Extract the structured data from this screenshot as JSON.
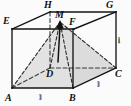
{
  "figure": {
    "name": "cube-with-inscribed-pyramid",
    "background_color": "#fbfbfb",
    "stroke_color": "#1a1a1a",
    "shade_color": "#d8d8d8",
    "dash_color": "#3a3a3a"
  },
  "vertices": [
    {
      "id": "A",
      "label": "A",
      "x": 12,
      "y": 88,
      "label_x": 6,
      "label_y": 93
    },
    {
      "id": "B",
      "label": "B",
      "x": 73,
      "y": 88,
      "label_x": 70,
      "label_y": 93
    },
    {
      "id": "C",
      "label": "C",
      "x": 116,
      "y": 68,
      "label_x": 115,
      "label_y": 70
    },
    {
      "id": "D",
      "label": "D",
      "x": 50,
      "y": 68,
      "label_x": 47,
      "label_y": 70
    },
    {
      "id": "E",
      "label": "E",
      "x": 12,
      "y": 29,
      "label_x": 3,
      "label_y": 17
    },
    {
      "id": "F",
      "label": "F",
      "x": 74,
      "y": 29,
      "label_x": 70,
      "label_y": 18
    },
    {
      "id": "G",
      "label": "G",
      "x": 116,
      "y": 12,
      "label_x": 108,
      "label_y": 1
    },
    {
      "id": "H",
      "label": "H",
      "x": 50,
      "y": 12,
      "label_x": 45,
      "label_y": 1
    },
    {
      "id": "M",
      "label": "M",
      "x": 60,
      "y": 22,
      "label_x": 56,
      "label_y": 12
    }
  ],
  "edge_labels": [
    {
      "id": "AB",
      "text": "1",
      "x": 41,
      "y": 92
    },
    {
      "id": "BC",
      "text": "1",
      "x": 98,
      "y": 79
    },
    {
      "id": "CG",
      "text": "1",
      "x": 118,
      "y": 36
    }
  ],
  "solid_edges": [
    {
      "from": "A",
      "to": "B"
    },
    {
      "from": "B",
      "to": "C"
    },
    {
      "from": "A",
      "to": "E"
    },
    {
      "from": "B",
      "to": "F"
    },
    {
      "from": "C",
      "to": "G"
    },
    {
      "from": "E",
      "to": "F"
    },
    {
      "from": "F",
      "to": "G"
    },
    {
      "from": "E",
      "to": "H"
    },
    {
      "from": "H",
      "to": "G"
    }
  ],
  "hidden_edges": [
    {
      "from": "A",
      "to": "D"
    },
    {
      "from": "D",
      "to": "C"
    },
    {
      "from": "D",
      "to": "H"
    }
  ],
  "pyramid_edges": [
    {
      "from": "A",
      "to": "M"
    },
    {
      "from": "B",
      "to": "M"
    },
    {
      "from": "C",
      "to": "M"
    },
    {
      "from": "D",
      "to": "M"
    }
  ],
  "shaded_faces": [
    {
      "id": "ABM",
      "points": "12,88 73,88 60,22"
    },
    {
      "id": "BCM",
      "points": "73,88 116,68 60,22"
    }
  ],
  "arrow": {
    "from": "D",
    "to": "M",
    "head": "up"
  },
  "caption": ""
}
